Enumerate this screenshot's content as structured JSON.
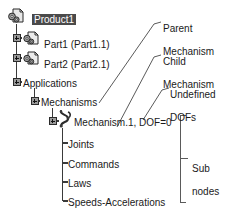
{
  "diagram": {
    "colors": {
      "line": "#3a3a3a",
      "text": "#1a1a1a",
      "selection_bg": "#4a4a4a",
      "selection_fg": "#ffffff",
      "icon_fill": "#b8b8b8",
      "icon_stroke": "#2b2b2b"
    }
  },
  "tree": {
    "nodes": [
      {
        "id": "product1",
        "label": "Product1",
        "icon": "product-icon",
        "selected": true,
        "expander": null,
        "depth": 0,
        "x": 32,
        "y": 13
      },
      {
        "id": "part1",
        "label": "Part1 (Part1.1)",
        "icon": "part-icon",
        "selected": false,
        "expander": "plus",
        "depth": 1,
        "x": 44,
        "y": 38
      },
      {
        "id": "part2",
        "label": "Part2 (Part2.1)",
        "icon": "part-icon",
        "selected": false,
        "expander": "plus",
        "depth": 1,
        "x": 44,
        "y": 58
      },
      {
        "id": "applications",
        "label": "Applications",
        "icon": null,
        "selected": false,
        "expander": "plus",
        "depth": 1,
        "x": 25,
        "y": 82
      },
      {
        "id": "mechanisms",
        "label": "Mechanisms",
        "icon": null,
        "selected": false,
        "expander": "plus",
        "depth": 2,
        "x": 42,
        "y": 101
      },
      {
        "id": "mechanism1",
        "label": "Mechanism.1, DOF=0",
        "icon": "mechanism-icon",
        "selected": false,
        "expander": "plus",
        "depth": 3,
        "x": 72,
        "y": 121
      },
      {
        "id": "joints",
        "label": "Joints",
        "icon": null,
        "selected": false,
        "expander": null,
        "depth": 4,
        "x": 67,
        "y": 143
      },
      {
        "id": "commands",
        "label": "Commands",
        "icon": null,
        "selected": false,
        "expander": null,
        "depth": 4,
        "x": 67,
        "y": 163
      },
      {
        "id": "laws",
        "label": "Laws",
        "icon": null,
        "selected": false,
        "expander": null,
        "depth": 4,
        "x": 67,
        "y": 182
      },
      {
        "id": "speeds",
        "label": "Speeds-Accelerations",
        "icon": null,
        "selected": false,
        "expander": null,
        "depth": 4,
        "x": 67,
        "y": 201
      }
    ]
  },
  "annotations": [
    {
      "id": "parent-mechanism",
      "line1": "Parent",
      "line2": "Mechanism",
      "x": 163,
      "y": 10
    },
    {
      "id": "child-mechanism",
      "line1": "Child",
      "line2": "Mechanism",
      "x": 163,
      "y": 42
    },
    {
      "id": "undefined-dofs",
      "line1": "Undefined",
      "line2": "DOFs",
      "x": 170,
      "y": 75
    },
    {
      "id": "sub-nodes",
      "line1": "Sub",
      "line2": "nodes",
      "x": 192,
      "y": 152
    }
  ]
}
